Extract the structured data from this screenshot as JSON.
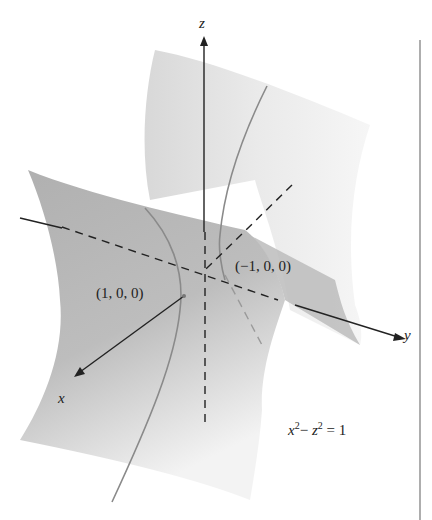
{
  "figure": {
    "axes": {
      "x_label": "x",
      "y_label": "y",
      "z_label": "z"
    },
    "points": [
      {
        "label": "(1, 0, 0)"
      },
      {
        "label": "(−1, 0, 0)"
      }
    ],
    "equation": {
      "lhs_x": "x",
      "x_exp": "2",
      "minus": "−",
      "lhs_z": "z",
      "z_exp": "2",
      "rhs": "= 1"
    },
    "surface": "hyperbolic cylinder",
    "colors": {
      "surface_dark": "#a9a9a9",
      "surface_light": "#e6e6e6",
      "curve": "#888888",
      "axis": "#222222"
    }
  }
}
